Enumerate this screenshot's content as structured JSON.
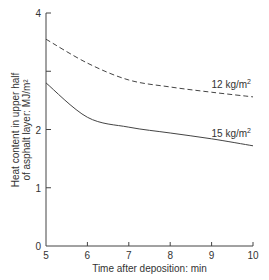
{
  "chart_data": {
    "type": "line",
    "title": "",
    "xlabel": "Time after deposition: min",
    "ylabel_line1": "Heat content in upper half",
    "ylabel_line2": "of asphalt layer: MJ/m²",
    "xlim": [
      5,
      10
    ],
    "ylim": [
      0,
      4
    ],
    "x_ticks": [
      "5",
      "6",
      "7",
      "8",
      "9",
      "10"
    ],
    "y_ticks": [
      "0",
      "1",
      "2",
      "",
      "4"
    ],
    "grid": false,
    "legend": "inline labels at right end of curves",
    "x": [
      5,
      6,
      7,
      8,
      9,
      10
    ],
    "series": [
      {
        "name": "12 kg/m²",
        "label": "12 kg/m",
        "sup": "2",
        "style": "dashed",
        "values": [
          3.55,
          3.14,
          2.85,
          2.73,
          2.64,
          2.56
        ]
      },
      {
        "name": "15 kg/m²",
        "label": "15 kg/m",
        "sup": "2",
        "style": "solid",
        "values": [
          2.8,
          2.21,
          2.04,
          1.94,
          1.84,
          1.72
        ]
      }
    ]
  }
}
